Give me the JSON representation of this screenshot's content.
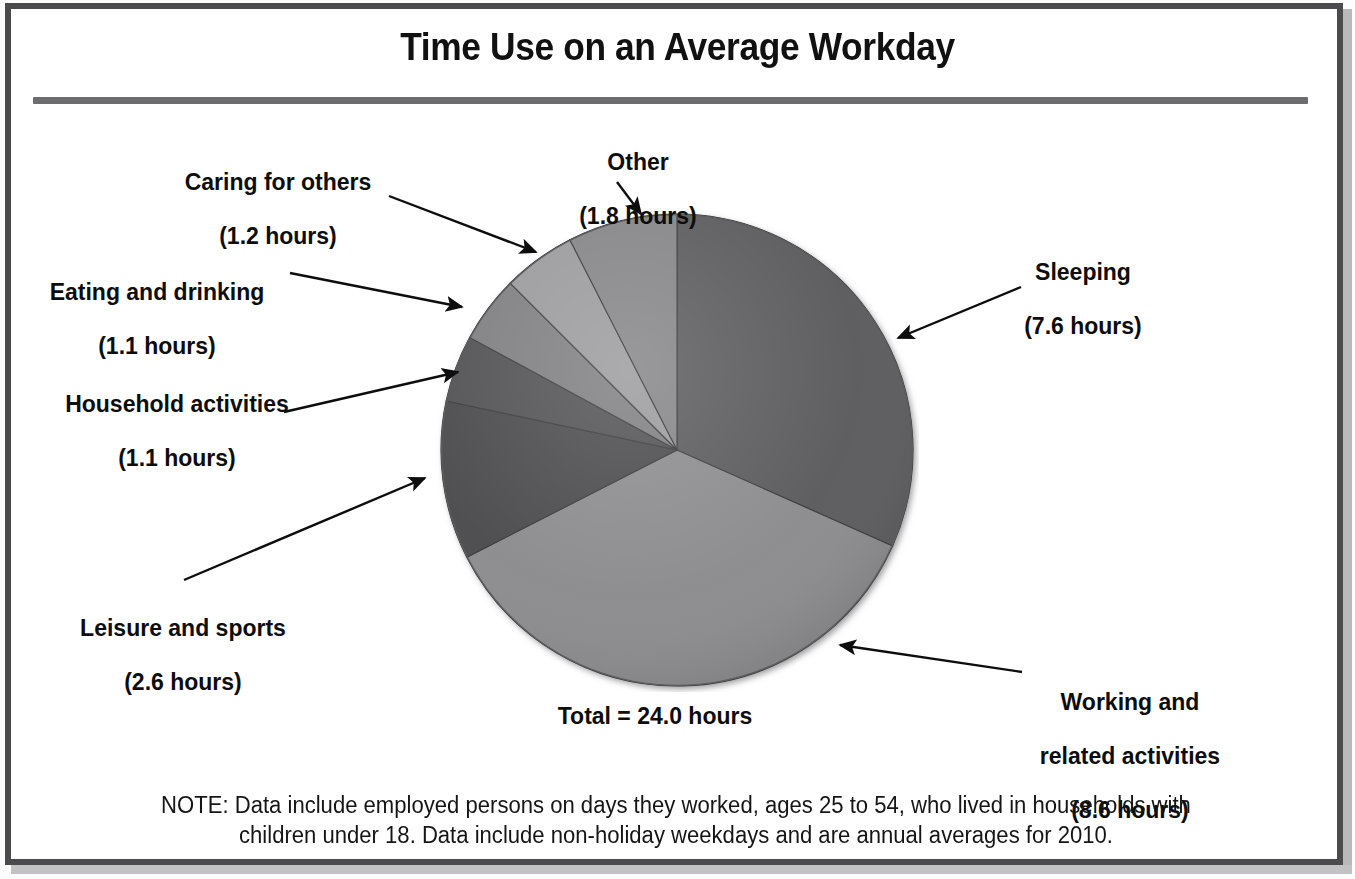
{
  "chart_data": {
    "type": "pie",
    "title": "Time Use on an Average Workday",
    "total_label": "Total = 24.0 hours",
    "total": 24.0,
    "unit": "hours",
    "note_line1": "NOTE: Data include employed persons on days they worked, ages 25 to 54, who lived in households with",
    "note_line2": "children under 18. Data include non-holiday weekdays and are annual averages for 2010.",
    "categories": [
      "Sleeping",
      "Working and related activities",
      "Leisure and sports",
      "Household activities",
      "Eating and drinking",
      "Caring for others",
      "Other"
    ],
    "values": [
      7.6,
      8.6,
      2.6,
      1.1,
      1.1,
      1.2,
      1.8
    ],
    "value_labels": [
      "(7.6 hours)",
      "(8.6 hours)",
      "(2.6 hours)",
      "(1.1 hours)",
      "(1.1 hours)",
      "(1.2 hours)",
      "(1.8 hours)"
    ],
    "degrees": [
      114,
      129,
      39,
      16.5,
      16.5,
      18,
      27
    ],
    "start_angle_deg": 0,
    "direction": "clockwise",
    "slice_colors": [
      "#5a5a5c",
      "#8b8b8d",
      "#4a4a4c",
      "#515153",
      "#7e7e80",
      "#9a9a9c",
      "#848486"
    ],
    "legend": "none",
    "grid": false,
    "xlabel": "",
    "ylabel": ""
  },
  "header": {
    "title": "Time Use on an Average Workday"
  },
  "labels": {
    "other": {
      "name": "Other",
      "value": "(1.8 hours)"
    },
    "caring": {
      "name": "Caring for others",
      "value": "(1.2 hours)"
    },
    "eating": {
      "name": "Eating and drinking",
      "value": "(1.1 hours)"
    },
    "household": {
      "name": "Household activities",
      "value": "(1.1 hours)"
    },
    "leisure": {
      "name": "Leisure and sports",
      "value": "(2.6 hours)"
    },
    "sleeping": {
      "name": "Sleeping",
      "value": "(7.6 hours)"
    },
    "working": {
      "name": "Working and",
      "name2": "related activities",
      "value": "(8.6 hours)"
    }
  },
  "footer": {
    "total": "Total = 24.0 hours",
    "note_line1": "NOTE: Data include employed persons on days they worked, ages 25 to 54, who lived in households with",
    "note_line2": "children under 18. Data include non-holiday weekdays and are annual averages for 2010."
  },
  "colors": {
    "frame": "#4b4b4d",
    "rule": "#6d6d70",
    "text": "#0d0d0d",
    "pie_darkest": "#4a4a4c",
    "pie_lightest": "#9a9a9c"
  }
}
